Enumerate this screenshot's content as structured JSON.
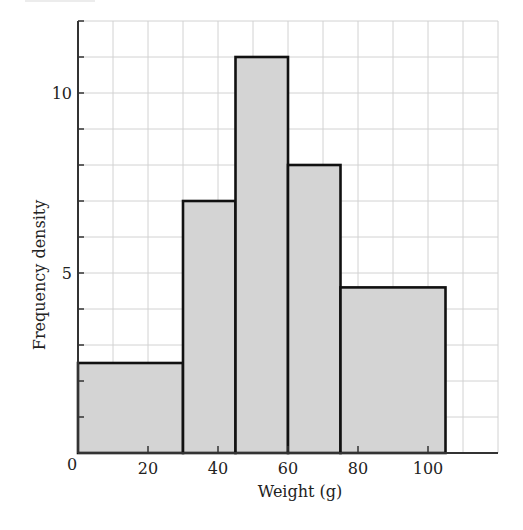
{
  "chart_data": {
    "type": "bar",
    "subtype": "histogram",
    "title": "",
    "xlabel": "Weight (g)",
    "ylabel": "Frequency density",
    "xlim": [
      0,
      120
    ],
    "ylim": [
      0,
      12
    ],
    "grid": true,
    "grid_x_step": 10,
    "grid_y_step": 1,
    "x_ticks": [
      0,
      20,
      40,
      60,
      80,
      100
    ],
    "x_tick_labels": [
      "0",
      "20",
      "40",
      "60",
      "80",
      "100"
    ],
    "y_ticks": [
      5,
      10
    ],
    "y_tick_labels": [
      "5",
      "10"
    ],
    "bins": [
      {
        "start": 0,
        "end": 30,
        "value": 2.5
      },
      {
        "start": 30,
        "end": 45,
        "value": 7
      },
      {
        "start": 45,
        "end": 60,
        "value": 11
      },
      {
        "start": 60,
        "end": 75,
        "value": 8
      },
      {
        "start": 75,
        "end": 105,
        "value": 4.6
      }
    ],
    "categories": [
      "0-30",
      "30-45",
      "45-60",
      "60-75",
      "75-105"
    ],
    "values": [
      2.5,
      7,
      11,
      8,
      4.6
    ],
    "legend": null
  },
  "colors": {
    "bar_fill": "#d4d4d4",
    "bar_stroke": "#111111",
    "grid": "#d2d2d2",
    "axis": "#333333"
  }
}
